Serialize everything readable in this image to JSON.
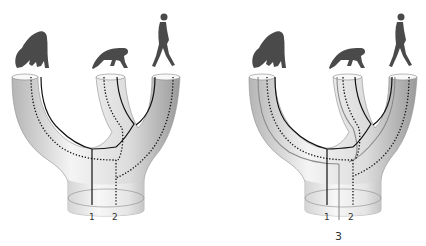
{
  "diagram": {
    "type": "gene tree within species tree",
    "species": [
      "gorilla",
      "chimpanzee",
      "human"
    ],
    "panels": [
      {
        "id": "left",
        "lineages": [
          {
            "label": "1",
            "style": "solid black"
          },
          {
            "label": "2",
            "style": "dotted black"
          }
        ]
      },
      {
        "id": "right",
        "lineages": [
          {
            "label": "1",
            "style": "solid black"
          },
          {
            "label": "2",
            "style": "dotted black"
          },
          {
            "label": "3",
            "style": "solid gray"
          }
        ]
      }
    ]
  },
  "labels": {
    "left": {
      "l1": "1",
      "l2": "2"
    },
    "right": {
      "l1": "1",
      "l2": "2",
      "l3": "3"
    }
  },
  "colors": {
    "tube_light": "#f2f2f2",
    "tube_dark": "#a8a8a8",
    "silhouette": "#4a4a4a",
    "line_black": "#111111",
    "line_gray": "#8a8a8a"
  }
}
